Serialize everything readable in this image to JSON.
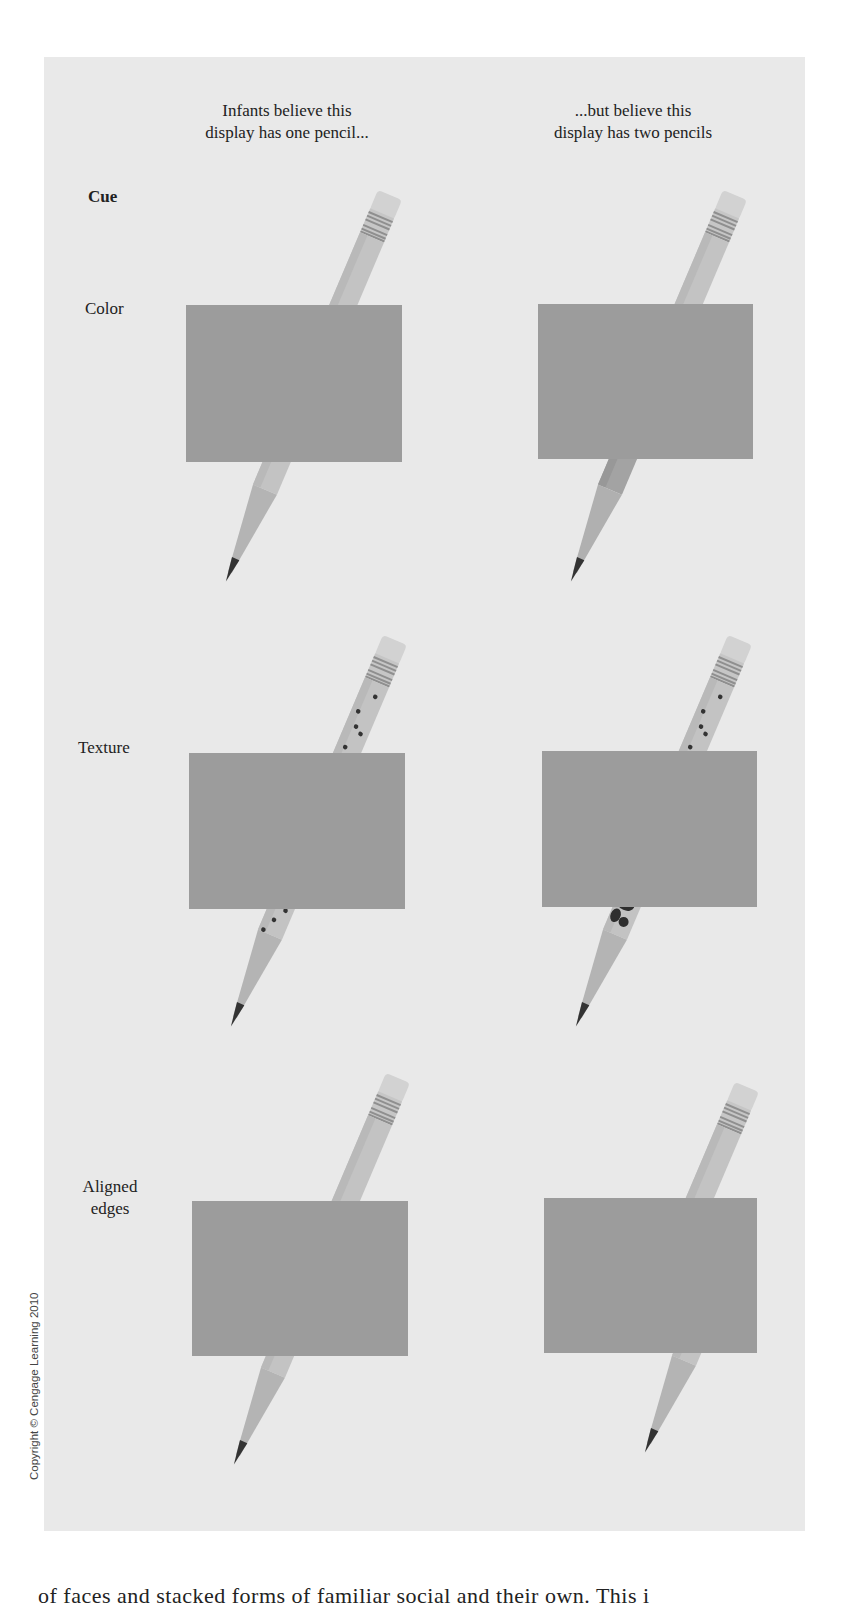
{
  "figure": {
    "column_headers": [
      {
        "line1": "Infants believe this",
        "line2": "display has one pencil..."
      },
      {
        "line1": "...but believe this",
        "line2": "display has two pencils"
      }
    ],
    "cue_header": "Cue",
    "rows": [
      {
        "label_line1": "Color",
        "label_line2": "",
        "left": "same-color-pencil",
        "right": "different-color-lower-pencil"
      },
      {
        "label_line1": "Texture",
        "label_line2": "",
        "left": "same-dotted-texture",
        "right": "different-blotchy-texture-lower"
      },
      {
        "label_line1": "Aligned",
        "label_line2": "edges",
        "left": "aligned-pencil",
        "right": "misaligned-lower-pencil"
      }
    ],
    "colors": {
      "panel_bg": "#e9e9e9",
      "occluder": "#9c9c9c",
      "pencil_body": "#c9c9c9",
      "pencil_dark": "#8d8d8d",
      "lead": "#333333"
    }
  },
  "copyright": "Copyright © Cengage Learning 2010",
  "bottom_text": "of faces and stacked forms of familiar social and their own. This i"
}
